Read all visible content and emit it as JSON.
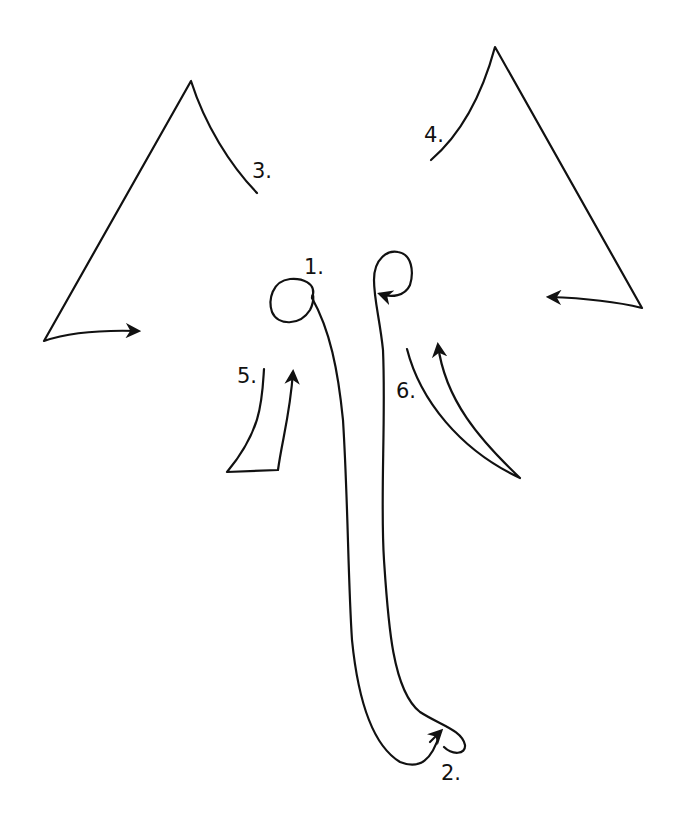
{
  "diagram": {
    "stroke_color": "#111111",
    "background": "#ffffff",
    "steps": [
      {
        "label": "1.",
        "part": "trunk-top-with-eye-loops"
      },
      {
        "label": "2.",
        "part": "trunk-tip-curl"
      },
      {
        "label": "3.",
        "part": "left-ear"
      },
      {
        "label": "4.",
        "part": "right-ear"
      },
      {
        "label": "5.",
        "part": "left-tusk"
      },
      {
        "label": "6.",
        "part": "right-tusk"
      }
    ]
  }
}
